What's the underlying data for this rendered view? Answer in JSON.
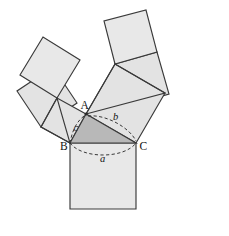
{
  "figure": {
    "canvas": {
      "width": 229,
      "height": 236,
      "background": "#ffffff"
    },
    "colors": {
      "square_fill": "#e8e8e8",
      "square_fill_alt": "#e3e3e3",
      "triangle_fill": "#b8b8b8",
      "stroke": "#3a3a3a",
      "arc_stroke": "#2f2f2f",
      "label": "#121212"
    },
    "vertex_labels": [
      {
        "id": "A",
        "text": "A",
        "x": 80.5,
        "y": 108.5
      },
      {
        "id": "B",
        "text": "B",
        "x": 60.0,
        "y": 150.0
      },
      {
        "id": "C",
        "text": "C",
        "x": 139.5,
        "y": 150.0
      }
    ],
    "side_labels": [
      {
        "id": "a",
        "text": "a",
        "x": 100.0,
        "y": 161.5,
        "side": "BC"
      },
      {
        "id": "b",
        "text": "b",
        "x": 113.0,
        "y": 120.0,
        "side": "AC"
      },
      {
        "id": "c",
        "text": "c",
        "x": 73.5,
        "y": 130.5,
        "side": "AB"
      }
    ],
    "triangle": {
      "name": "main-triangle-ABC",
      "points": "86,114 70,143 136,143",
      "fill": "#b8b8b8"
    },
    "arcs": [
      {
        "id": "arc-a",
        "d": "M 70,143 C 82,159 124,159 136,143"
      },
      {
        "id": "arc-b",
        "d": "M 88,116 C 106,114 130,128 136,141"
      },
      {
        "id": "arc-c",
        "d": "M 84,116 C 76,122 72,132 70.5,141"
      }
    ],
    "squares": [
      {
        "id": "square-on-a",
        "points": "70,143 136,143 136,209 70,209",
        "fill": "#e8e8e8"
      },
      {
        "id": "square-on-b",
        "points": "86,114 136,143 165,93 115,64",
        "fill": "#e3e3e3"
      },
      {
        "id": "square-on-c",
        "points": "70,143 86,114 57,98 41,127",
        "fill": "#e3e3e3"
      },
      {
        "id": "square-b-sub-left",
        "points": "115,64 104,21 146,10 157,52",
        "fill": "#e8e8e8"
      },
      {
        "id": "square-b-sub-right",
        "points": "115,64 157,52 169,94 127,106",
        "fill": "#e3e3e3"
      },
      {
        "id": "square-c-sub-upper",
        "points": "57,98 20,75 43,37 80,60",
        "fill": "#e8e8e8"
      },
      {
        "id": "square-c-sub-lower",
        "points": "41,127 17,91 53,67 77,103",
        "fill": "#e3e3e3"
      }
    ],
    "branch_triangles": [
      {
        "id": "branch-triangle-b",
        "points": "86,114 165,93 115,64"
      },
      {
        "id": "branch-triangle-c",
        "points": "70,143 41,127 57,98"
      }
    ],
    "vertex_dots": [
      {
        "id": "dot-A",
        "cx": 86,
        "cy": 114,
        "r": 1.6
      }
    ]
  }
}
